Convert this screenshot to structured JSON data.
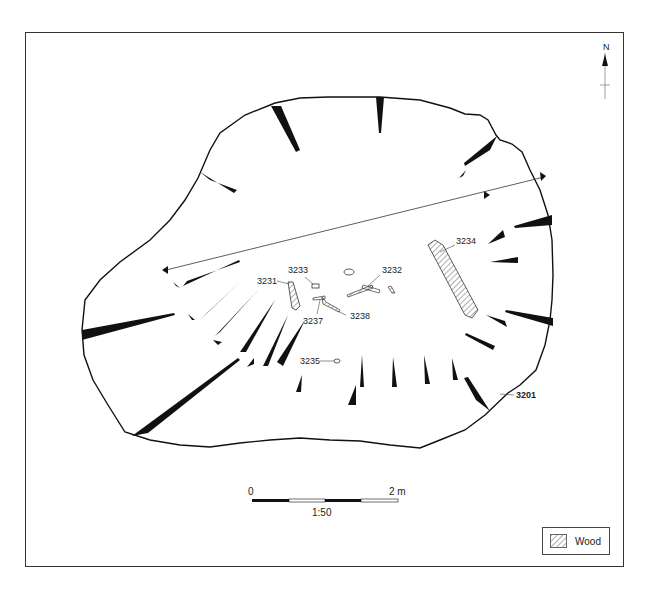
{
  "figure": {
    "type": "archaeological plan",
    "feature_label": "3201",
    "north_label": "N",
    "contexts": [
      {
        "id": "3231",
        "label": "3231"
      },
      {
        "id": "3232",
        "label": "3232"
      },
      {
        "id": "3233",
        "label": "3233"
      },
      {
        "id": "3234",
        "label": "3234"
      },
      {
        "id": "3235",
        "label": "3235"
      },
      {
        "id": "3237",
        "label": "3237"
      },
      {
        "id": "3238",
        "label": "3238"
      }
    ]
  },
  "scale_bar": {
    "start_label": "0",
    "end_label": "2 m",
    "ratio_label": "1:50"
  },
  "legend": {
    "items": [
      {
        "label": "Wood",
        "pattern": "diagonal-hatch"
      }
    ]
  },
  "colors": {
    "ink": "#111111",
    "frame": "#333333",
    "background": "#ffffff"
  }
}
